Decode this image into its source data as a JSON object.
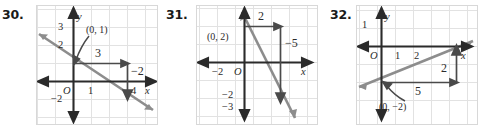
{
  "worksheet": {
    "panel_count": 3,
    "grid_color": "#e2e2e2",
    "axis_color": "#2b2b2b",
    "line_color": "#8d8d8d",
    "arrow_color": "#4a4a4a",
    "box_border": "#d8d8d8"
  },
  "panels": [
    {
      "number": "30.",
      "point_label": "(0, 1)",
      "run_label": "3",
      "rise_label": "−2",
      "y_ticks": [
        "3",
        "2",
        "−2"
      ],
      "x_ticks": [
        "1",
        "4"
      ],
      "origin_label": "O",
      "x_axis_name": "x",
      "y_axis_name": "y",
      "chart": {
        "type": "line",
        "intercept": 1,
        "slope": -0.6667,
        "run": 3,
        "rise": -2
      }
    },
    {
      "number": "31.",
      "point_label": "(0, 2)",
      "run_label": "2",
      "rise_label": "−5",
      "y_ticks": [
        "−2",
        "−3"
      ],
      "x_ticks": [
        "−2"
      ],
      "origin_label": "O",
      "x_axis_name": "x",
      "y_axis_name": "y",
      "chart": {
        "type": "line",
        "intercept": 2,
        "slope": -2.5,
        "run": 2,
        "rise": -5
      }
    },
    {
      "number": "32.",
      "point_label": "(0, −2)",
      "run_label": "5",
      "rise_label": "2",
      "y_ticks": [
        "1"
      ],
      "x_ticks": [
        "1",
        "2"
      ],
      "origin_label": "O",
      "x_axis_name": "x",
      "y_axis_name": "y",
      "chart": {
        "type": "line",
        "intercept": -2,
        "slope": 0.4,
        "run": 5,
        "rise": 2
      }
    }
  ]
}
